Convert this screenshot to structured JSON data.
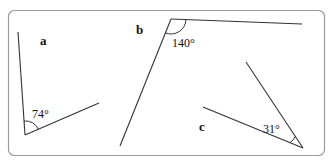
{
  "diagram": {
    "frame": {
      "border_color": "#9a9a9a"
    },
    "angles": [
      {
        "id": "a",
        "label": "a",
        "value": "74°"
      },
      {
        "id": "b",
        "label": "b",
        "value": "140°"
      },
      {
        "id": "c",
        "label": "c",
        "value": "31°"
      }
    ],
    "line_color": "#333333"
  }
}
